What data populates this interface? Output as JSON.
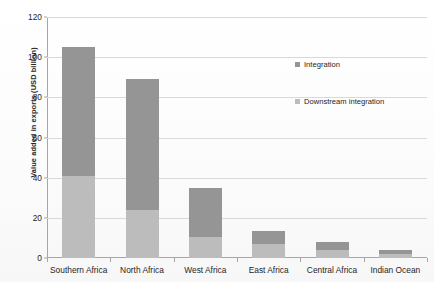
{
  "chart_data": {
    "type": "bar",
    "subtype": "stacked",
    "title": "",
    "xlabel": "",
    "ylabel": "Value added in exports (USD billion)",
    "ylim": [
      0,
      120
    ],
    "yticks": [
      0,
      20,
      40,
      60,
      80,
      100,
      120
    ],
    "ytick_labels": [
      "0",
      "20",
      "40",
      "60",
      "80",
      "100",
      "120"
    ],
    "grid": "horizontal",
    "legend_position": "right",
    "categories": [
      "Southern Africa",
      "North Africa",
      "West Africa",
      "East Africa",
      "Central Africa",
      "Indian Ocean"
    ],
    "series": [
      {
        "name": "Downstream integration",
        "color": "#bcbcbc",
        "values": [
          41,
          24,
          10.5,
          7,
          4,
          2
        ]
      },
      {
        "name": "Integration",
        "color": "#959595",
        "values": [
          64,
          65,
          24.5,
          6.5,
          4,
          2
        ]
      }
    ],
    "totals": [
      105,
      89,
      35,
      13.5,
      8,
      4
    ]
  },
  "legend": {
    "items": [
      {
        "label": "Integration",
        "color": "#959595"
      },
      {
        "label": "Downstream integration",
        "color": "#bcbcbc"
      }
    ]
  }
}
